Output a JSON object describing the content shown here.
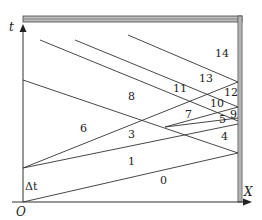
{
  "diagram": {
    "axes": {
      "vertical_label": "t",
      "horizontal_label": "X",
      "origin_label": "O",
      "interval_label": "Δt"
    },
    "regions": [
      {
        "id": "r0",
        "label": "0"
      },
      {
        "id": "r1",
        "label": "1"
      },
      {
        "id": "r3",
        "label": "3"
      },
      {
        "id": "r4",
        "label": "4"
      },
      {
        "id": "r5",
        "label": "5"
      },
      {
        "id": "r6",
        "label": "6"
      },
      {
        "id": "r7",
        "label": "7"
      },
      {
        "id": "r8",
        "label": "8"
      },
      {
        "id": "r9",
        "label": "9"
      },
      {
        "id": "r10",
        "label": "10"
      },
      {
        "id": "r11",
        "label": "11"
      },
      {
        "id": "r12",
        "label": "12"
      },
      {
        "id": "r13",
        "label": "13"
      },
      {
        "id": "r14",
        "label": "14"
      }
    ]
  }
}
